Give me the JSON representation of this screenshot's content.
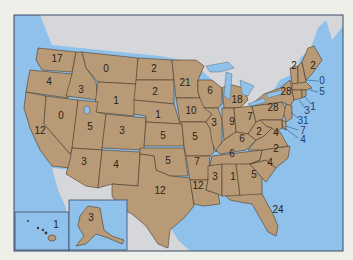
{
  "map": {
    "title": "",
    "colors": {
      "page_background": "#efefe9",
      "ocean": "#8fc1ea",
      "land": "#b89b76",
      "foreign_land": "#d5d7db",
      "border": "#4a3a2a",
      "lakes": "#8fc1ea"
    },
    "states": [
      {
        "id": "WA",
        "value": "17"
      },
      {
        "id": "OR",
        "value": "4"
      },
      {
        "id": "CA",
        "value": "12"
      },
      {
        "id": "NV",
        "value": "0"
      },
      {
        "id": "ID",
        "value": "3"
      },
      {
        "id": "MT",
        "value": "0"
      },
      {
        "id": "WY",
        "value": "1"
      },
      {
        "id": "UT",
        "value": "5"
      },
      {
        "id": "AZ",
        "value": "3"
      },
      {
        "id": "CO",
        "value": "3"
      },
      {
        "id": "NM",
        "value": "4"
      },
      {
        "id": "ND",
        "value": "2"
      },
      {
        "id": "SD",
        "value": "2"
      },
      {
        "id": "NE",
        "value": "1"
      },
      {
        "id": "KS",
        "value": "5"
      },
      {
        "id": "OK",
        "value": "5"
      },
      {
        "id": "TX",
        "value": "12"
      },
      {
        "id": "MN",
        "value": "21"
      },
      {
        "id": "IA",
        "value": "10"
      },
      {
        "id": "MO",
        "value": "5"
      },
      {
        "id": "AR",
        "value": "7"
      },
      {
        "id": "LA",
        "value": "12"
      },
      {
        "id": "WI",
        "value": "6"
      },
      {
        "id": "IL",
        "value": "3"
      },
      {
        "id": "MI",
        "value": "18"
      },
      {
        "id": "IN",
        "value": "9"
      },
      {
        "id": "OH",
        "value": "7"
      },
      {
        "id": "KY",
        "value": "6"
      },
      {
        "id": "TN",
        "value": "6"
      },
      {
        "id": "MS",
        "value": "3"
      },
      {
        "id": "AL",
        "value": "1"
      },
      {
        "id": "GA",
        "value": "5"
      },
      {
        "id": "FL",
        "value": "24"
      },
      {
        "id": "SC",
        "value": "4"
      },
      {
        "id": "NC",
        "value": "2"
      },
      {
        "id": "VA",
        "value": "4"
      },
      {
        "id": "WV",
        "value": "2"
      },
      {
        "id": "PA",
        "value": "28"
      },
      {
        "id": "NY",
        "value": "28"
      },
      {
        "id": "VT",
        "value": "2"
      },
      {
        "id": "ME",
        "value": "2"
      },
      {
        "id": "NH",
        "value": "0"
      },
      {
        "id": "MA",
        "value": "5"
      },
      {
        "id": "RI",
        "value": "1"
      },
      {
        "id": "CT",
        "value": "3"
      },
      {
        "id": "NJ",
        "value": "31"
      },
      {
        "id": "DE",
        "value": "7"
      },
      {
        "id": "MD",
        "value": "4"
      },
      {
        "id": "AK",
        "value": "3"
      },
      {
        "id": "HI",
        "value": "1"
      }
    ]
  }
}
